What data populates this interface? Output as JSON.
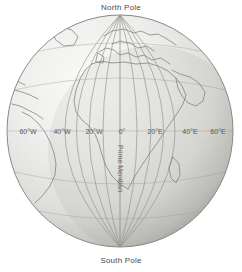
{
  "figure": {
    "name": "globe-graticule-figure",
    "background_color": "#ffffff"
  },
  "poles": {
    "north_label": "North Pole",
    "south_label": "South Pole"
  },
  "prime_meridian": {
    "vertical_label": "Prime Meridian"
  },
  "meridian_labels": [
    {
      "text": "60°W",
      "x": 28,
      "y": 131
    },
    {
      "text": "40°W",
      "x": 62,
      "y": 131
    },
    {
      "text": "20°W",
      "x": 94,
      "y": 131
    },
    {
      "text": "0°",
      "x": 122,
      "y": 131
    },
    {
      "text": "20°E",
      "x": 155,
      "y": 131
    },
    {
      "text": "40°E",
      "x": 190,
      "y": 131
    },
    {
      "text": "60°E",
      "x": 218,
      "y": 131
    }
  ],
  "colors": {
    "sphere_light": "#f2f2f0",
    "sphere_mid": "#dcdcd8",
    "sphere_edge": "#a9a9a5",
    "outline": "#8a8a86",
    "graticule": "#9a9a96",
    "coastline": "#8c8c88",
    "text": "#4a4a4a"
  },
  "globe": {
    "center_x": 120,
    "center_y": 131,
    "radius_x": 113,
    "radius_y": 116
  }
}
